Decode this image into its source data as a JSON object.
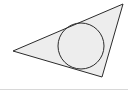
{
  "figure": {
    "background_color": "#ffffff",
    "width": 128,
    "height": 90,
    "bottom_rule_color": "#d8d8d8"
  },
  "chart_data": {
    "type": "diagram",
    "subtitle": "",
    "xlabel": "",
    "ylabel": "",
    "grid": false,
    "legend": "none",
    "xlim": [
      0,
      128
    ],
    "ylim": [
      0,
      90
    ],
    "shapes": [
      {
        "name": "triangle",
        "kind": "polygon",
        "fill": "#ededed",
        "stroke": "#2b2b2b",
        "stroke_width": 1,
        "points": [
          {
            "label": "A",
            "x": 13,
            "y": 51
          },
          {
            "label": "B",
            "x": 123,
            "y": 4
          },
          {
            "label": "C",
            "x": 102,
            "y": 77
          }
        ],
        "points_string": "13,51 123,4 102,77"
      },
      {
        "name": "inscribed-circle",
        "kind": "circle",
        "fill": "none",
        "stroke": "#2b2b2b",
        "stroke_width": 1,
        "cx": 81,
        "cy": 46,
        "r": 23
      }
    ],
    "annotations": []
  }
}
